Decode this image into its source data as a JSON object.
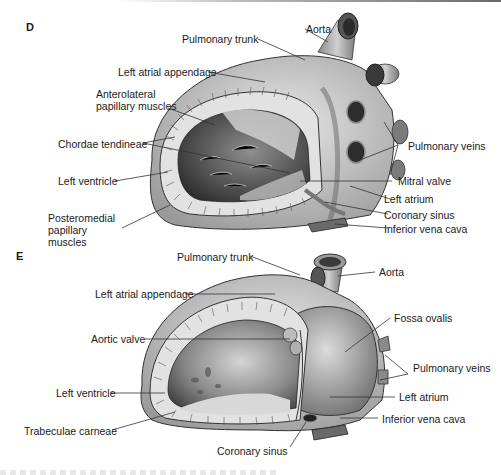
{
  "figure": {
    "panels": [
      {
        "letter": "D",
        "labels": {
          "aorta": "Aorta",
          "pulmonary_trunk": "Pulmonary trunk",
          "left_atrial_appendage": "Left atrial appendage",
          "anterolateral_papillary_muscles": "Anterolateral papillary muscles",
          "chordae_tendineae": "Chordae tendineae",
          "left_ventricle": "Left ventricle",
          "posteromedial_papillary_muscles": "Posteromedial papillary muscles",
          "pulmonary_veins": "Pulmonary veins",
          "mitral_valve": "Mitral valve",
          "left_atrium": "Left atrium",
          "coronary_sinus": "Coronary sinus",
          "inferior_vena_cava": "Inferior vena cava"
        }
      },
      {
        "letter": "E",
        "labels": {
          "pulmonary_trunk": "Pulmonary trunk",
          "aorta": "Aorta",
          "left_atrial_appendage": "Left atrial appendage",
          "fossa_ovalis": "Fossa ovalis",
          "aortic_valve": "Aortic valve",
          "pulmonary_veins": "Pulmonary veins",
          "left_ventricle": "Left ventricle",
          "left_atrium": "Left atrium",
          "inferior_vena_cava": "Inferior vena cava",
          "trabeculae_carneae": "Trabeculae carneae",
          "coronary_sinus": "Coronary sinus"
        }
      }
    ]
  },
  "colors": {
    "ink": "#1a1a1a",
    "tissue_light": "#d9d9d9",
    "tissue_mid": "#a8a8a8",
    "tissue_dark": "#555555",
    "leader": "#333333"
  }
}
